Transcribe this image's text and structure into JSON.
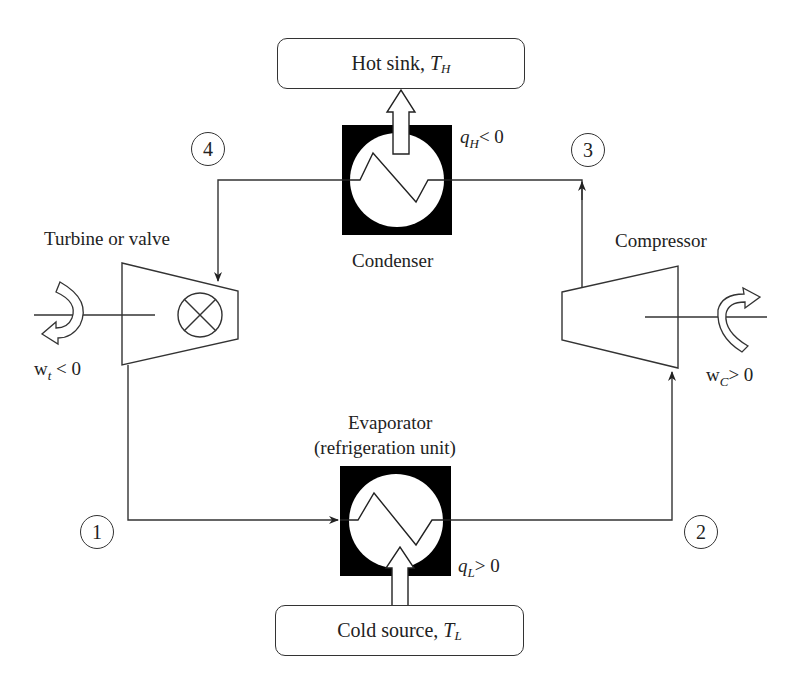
{
  "diagram": {
    "reservoirs": {
      "hot": {
        "label": "Hot sink, ",
        "symbol": "T",
        "subscript": "H"
      },
      "cold": {
        "label": "Cold source, ",
        "symbol": "T",
        "subscript": "L"
      }
    },
    "components": {
      "condenser": {
        "label": "Condenser"
      },
      "evaporator": {
        "label_line1": "Evaporator",
        "label_line2": "(refrigeration unit)"
      },
      "turbine": {
        "label": "Turbine or valve"
      },
      "compressor": {
        "label": "Compressor"
      }
    },
    "heat_flows": {
      "q_hot": {
        "symbol": "q",
        "subscript": "H",
        "relation": "< 0"
      },
      "q_cold": {
        "symbol": "q",
        "subscript": "L",
        "relation": "> 0"
      }
    },
    "work_flows": {
      "turbine_work": {
        "symbol": "w",
        "subscript": "t",
        "relation": "< 0"
      },
      "compressor_work": {
        "symbol": "w",
        "subscript": "C",
        "relation": "> 0"
      }
    },
    "state_points": [
      "1",
      "2",
      "3",
      "4"
    ],
    "colors": {
      "line": "#333333",
      "fill": "#000000",
      "background": "#ffffff"
    }
  }
}
